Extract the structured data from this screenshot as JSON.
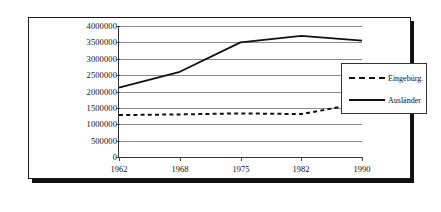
{
  "chart_data": {
    "type": "line",
    "title": "",
    "xlabel": "",
    "ylabel": "",
    "categories": [
      "1962",
      "1968",
      "1975",
      "1982",
      "1990"
    ],
    "x_tick_labels": [
      "1962",
      "1968",
      "1975",
      "1982",
      "1990"
    ],
    "y_tick_labels": [
      "0",
      "500000",
      "1000000",
      "1500000",
      "2000000",
      "2500000",
      "3000000",
      "3500000",
      "4000000"
    ],
    "y_tick_values": [
      0,
      500000,
      1000000,
      1500000,
      2000000,
      2500000,
      3000000,
      3500000,
      4000000
    ],
    "ylim": [
      0,
      4000000
    ],
    "grid": true,
    "legend_position": "right",
    "series": [
      {
        "name": "Eingebürg.",
        "style": "dashed",
        "color": "#111111",
        "values": [
          1280000,
          1300000,
          1330000,
          1310000,
          1650000
        ]
      },
      {
        "name": "Ausländer",
        "style": "solid",
        "color": "#111111",
        "values": [
          2120000,
          2600000,
          3500000,
          3700000,
          3550000
        ]
      }
    ]
  },
  "legend": {
    "items": [
      {
        "label": "Eingebürg.",
        "style": "dashed"
      },
      {
        "label": "Ausländer",
        "style": "solid"
      }
    ]
  }
}
